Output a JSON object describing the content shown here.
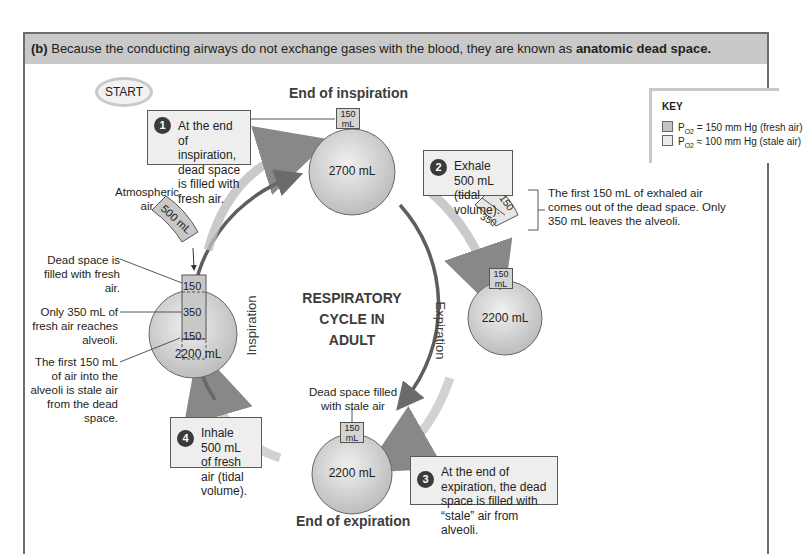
{
  "header": {
    "label": "(b)",
    "text": " Because the conducting airways do not exchange gases with the blood, they are known as ",
    "emphasis": "anatomic dead space."
  },
  "start": {
    "label": "START"
  },
  "key": {
    "title": "KEY",
    "items": [
      {
        "symbol": "P",
        "subscript": "O2",
        "text": " = 150 mm Hg (fresh air)",
        "color": "#c4c4c4"
      },
      {
        "symbol": "P",
        "subscript": "O2",
        "text": " ≈ 100 mm Hg (stale air)",
        "color": "#ebebeb"
      }
    ]
  },
  "center": {
    "line1": "RESPIRATORY",
    "line2": "CYCLE IN",
    "line3": "ADULT"
  },
  "arcs": {
    "inspiration": "Inspiration",
    "expiration": "Expiration"
  },
  "stages": {
    "top": {
      "title": "End of inspiration",
      "volume": "2700 mL",
      "dead_space": "150 mL"
    },
    "right": {
      "volume": "2200 mL",
      "dead_space": "150 mL"
    },
    "bottom": {
      "title": "End of expiration",
      "volume": "2200 mL",
      "dead_space": "150 mL",
      "note": "Dead space filled with stale air"
    },
    "left": {
      "volume": "2200 mL",
      "seg_top": "150",
      "seg_mid": "350",
      "seg_bottom": "150"
    }
  },
  "steps": [
    {
      "num": "1",
      "text": "At the end of inspiration, dead space is filled with fresh air."
    },
    {
      "num": "2",
      "text": "Exhale 500 mL (tidal volume)."
    },
    {
      "num": "3",
      "text": "At the end of expiration, the dead space is filled with “stale” air from alveoli."
    },
    {
      "num": "4",
      "text": "Inhale 500 mL of fresh air (tidal volume)."
    }
  ],
  "annotations": {
    "atmospheric": "Atmospheric air",
    "tube_500": "500 mL",
    "dead_space_fresh": "Dead space is filled with fresh air.",
    "only_350": "Only 350 mL of fresh air reaches alveoli.",
    "first_150_in": "The first 150 mL of air into the alveoli is stale air from the dead space.",
    "exhaled_note": "The first 150 mL of exhaled air comes out of the dead space. Only 350 mL leaves the alveoli.",
    "exhaled_150": "150",
    "exhaled_350": "350"
  }
}
